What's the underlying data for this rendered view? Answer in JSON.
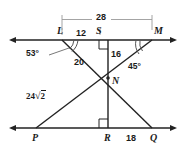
{
  "figure": {
    "type": "geometry-diagram",
    "stroke_color": "#222222",
    "bracket_color": "#999999",
    "background": "#ffffff",
    "points": [
      {
        "id": "L",
        "label": "L",
        "x": 62,
        "y": 37
      },
      {
        "id": "S",
        "label": "S",
        "x": 100,
        "y": 37
      },
      {
        "id": "M",
        "label": "M",
        "x": 152,
        "y": 37
      },
      {
        "id": "N",
        "label": "N",
        "x": 108,
        "y": 78
      },
      {
        "id": "P",
        "label": "P",
        "x": 36,
        "y": 134
      },
      {
        "id": "R",
        "label": "R",
        "x": 108,
        "y": 134
      },
      {
        "id": "Q",
        "label": "Q",
        "x": 152,
        "y": 134
      }
    ],
    "measures": [
      {
        "id": "LM",
        "label": "28",
        "segment": "L to M",
        "x": 101,
        "y": 19
      },
      {
        "id": "LS",
        "label": "12",
        "segment": "L to S",
        "x": 80,
        "y": 35
      },
      {
        "id": "SN",
        "label": "16",
        "segment": "S to N",
        "x": 114,
        "y": 54
      },
      {
        "id": "LN",
        "label": "20",
        "segment": "L to N",
        "x": 78,
        "y": 62
      },
      {
        "id": "PN",
        "label": "24",
        "label_radicand": "2",
        "segment": "P to N",
        "x": 34,
        "y": 96
      },
      {
        "id": "RQ",
        "label": "18",
        "segment": "R to Q",
        "x": 130,
        "y": 139
      }
    ],
    "angles": [
      {
        "id": "angle-L",
        "label": "53°",
        "vertex": "L",
        "x": 31,
        "y": 53
      },
      {
        "id": "angle-M",
        "label": "45°",
        "vertex": "M",
        "x": 131,
        "y": 66
      }
    ],
    "right_angles": [
      {
        "id": "right-angle-S",
        "vertex": "S"
      },
      {
        "id": "right-angle-R",
        "vertex": "R"
      }
    ]
  }
}
